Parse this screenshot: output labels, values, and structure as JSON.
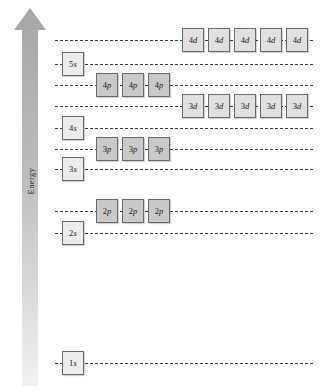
{
  "axis": {
    "label": "Energy",
    "direction": "up",
    "arrow_color": "#b3b3b3"
  },
  "colors": {
    "s_fill": "#ececec",
    "p_fill": "#c9c9c9",
    "d_fill": "#e0e0e0",
    "box_border": "#6a6a6a",
    "dash_line": "#3b3b3b",
    "background": "#ffffff"
  },
  "chart_data": {
    "type": "diagram",
    "title": "",
    "xlabel": "",
    "ylabel": "Energy",
    "levels": [
      {
        "label": "4d",
        "subshell": "d",
        "degeneracy": 5,
        "energy_rank": 10,
        "y": 40,
        "line_start": 55,
        "line_end": 313,
        "boxes_start": 182,
        "box_labels": [
          "4d",
          "4d",
          "4d",
          "4d",
          "4d"
        ]
      },
      {
        "label": "5s",
        "subshell": "s",
        "degeneracy": 1,
        "energy_rank": 9,
        "y": 64,
        "line_start": 55,
        "line_end": 313,
        "boxes_start": 62,
        "box_labels": [
          "5s"
        ]
      },
      {
        "label": "4p",
        "subshell": "p",
        "degeneracy": 3,
        "energy_rank": 8,
        "y": 85,
        "line_start": 55,
        "line_end": 313,
        "boxes_start": 96,
        "box_labels": [
          "4p",
          "4p",
          "4p"
        ]
      },
      {
        "label": "3d",
        "subshell": "d",
        "degeneracy": 5,
        "energy_rank": 7,
        "y": 106,
        "line_start": 55,
        "line_end": 313,
        "boxes_start": 182,
        "box_labels": [
          "3d",
          "3d",
          "3d",
          "3d",
          "3d"
        ]
      },
      {
        "label": "4s",
        "subshell": "s",
        "degeneracy": 1,
        "energy_rank": 6,
        "y": 128,
        "line_start": 55,
        "line_end": 313,
        "boxes_start": 62,
        "box_labels": [
          "4s"
        ]
      },
      {
        "label": "3p",
        "subshell": "p",
        "degeneracy": 3,
        "energy_rank": 5,
        "y": 149,
        "line_start": 55,
        "line_end": 313,
        "boxes_start": 96,
        "box_labels": [
          "3p",
          "3p",
          "3p"
        ]
      },
      {
        "label": "3s",
        "subshell": "s",
        "degeneracy": 1,
        "energy_rank": 4,
        "y": 169,
        "line_start": 55,
        "line_end": 313,
        "boxes_start": 62,
        "box_labels": [
          "3s"
        ]
      },
      {
        "label": "2p",
        "subshell": "p",
        "degeneracy": 3,
        "energy_rank": 3,
        "y": 211,
        "line_start": 55,
        "line_end": 313,
        "boxes_start": 96,
        "box_labels": [
          "2p",
          "2p",
          "2p"
        ]
      },
      {
        "label": "2s",
        "subshell": "s",
        "degeneracy": 1,
        "energy_rank": 2,
        "y": 233,
        "line_start": 55,
        "line_end": 313,
        "boxes_start": 62,
        "box_labels": [
          "2s"
        ]
      },
      {
        "label": "1s",
        "subshell": "s",
        "degeneracy": 1,
        "energy_rank": 1,
        "y": 363,
        "line_start": 55,
        "line_end": 313,
        "boxes_start": 62,
        "box_labels": [
          "1s"
        ]
      }
    ],
    "box_geometry": {
      "width": 22,
      "height": 24,
      "gap": 4
    }
  }
}
